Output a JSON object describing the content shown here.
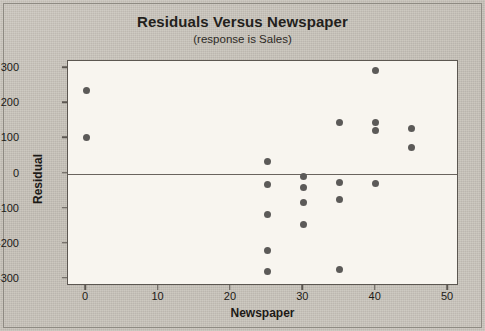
{
  "chart_data": {
    "type": "scatter",
    "title": "Residuals Versus Newspaper",
    "subtitle": "(response is Sales)",
    "xlabel": "Newspaper",
    "ylabel": "Residual",
    "xlim": [
      -2.5,
      51.5
    ],
    "ylim": [
      -320,
      320
    ],
    "xticks": [
      0,
      10,
      20,
      30,
      40,
      50
    ],
    "yticks": [
      300,
      200,
      100,
      0,
      -100,
      -200,
      -300
    ],
    "grid": false,
    "legend": null,
    "reference_line_y": 0,
    "point_color": "#5c5a58",
    "plot_background": "#f8f5ef",
    "page_background": "#c9c4bc",
    "frame_color": "#5c5751",
    "points": [
      {
        "x": 0,
        "y": 235
      },
      {
        "x": 0,
        "y": 103
      },
      {
        "x": 25,
        "y": 33
      },
      {
        "x": 25,
        "y": -31
      },
      {
        "x": 25,
        "y": -118
      },
      {
        "x": 25,
        "y": -218
      },
      {
        "x": 25,
        "y": -280
      },
      {
        "x": 30,
        "y": -8
      },
      {
        "x": 30,
        "y": -40
      },
      {
        "x": 30,
        "y": -83
      },
      {
        "x": 30,
        "y": -144
      },
      {
        "x": 35,
        "y": 146
      },
      {
        "x": 35,
        "y": -26
      },
      {
        "x": 35,
        "y": -75
      },
      {
        "x": 35,
        "y": -272
      },
      {
        "x": 40,
        "y": 292
      },
      {
        "x": 40,
        "y": 145
      },
      {
        "x": 40,
        "y": 122
      },
      {
        "x": 40,
        "y": -29
      },
      {
        "x": 45,
        "y": 128
      },
      {
        "x": 45,
        "y": 74
      }
    ]
  },
  "xtick_labels": [
    "0",
    "10",
    "20",
    "30",
    "40",
    "50"
  ],
  "ytick_labels": [
    "300",
    "200",
    "100",
    "0",
    "-100",
    "-200",
    "-300"
  ]
}
